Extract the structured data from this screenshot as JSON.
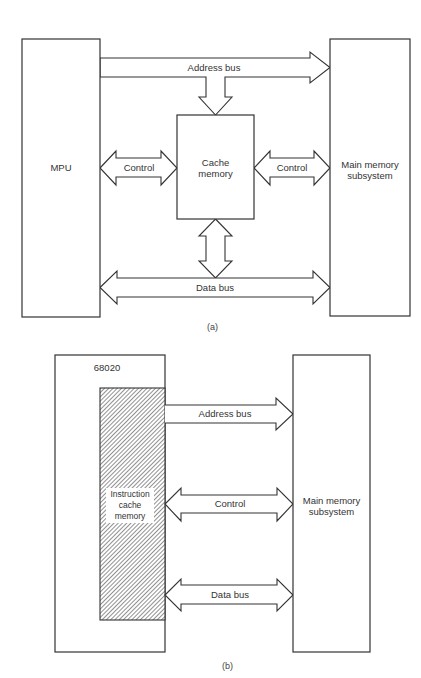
{
  "diagram_a": {
    "caption": "(a)",
    "mpu_label": "MPU",
    "cache_label_line1": "Cache",
    "cache_label_line2": "memory",
    "main_memory_line1": "Main memory",
    "main_memory_line2": "subsystem",
    "address_bus_label": "Address bus",
    "control_left_label": "Control",
    "control_right_label": "Control",
    "data_bus_label": "Data bus"
  },
  "diagram_b": {
    "caption": "(b)",
    "processor_label": "68020",
    "icache_line1": "Instruction",
    "icache_line2": "cache",
    "icache_line3": "memory",
    "main_memory_line1": "Main memory",
    "main_memory_line2": "subsystem",
    "address_bus_label": "Address bus",
    "control_label": "Control",
    "data_bus_label": "Data bus"
  },
  "colors": {
    "stroke": "#333333",
    "background": "#ffffff",
    "hatch": "#555555"
  }
}
